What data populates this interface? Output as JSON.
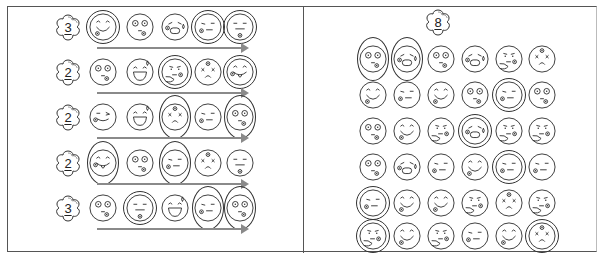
{
  "left_panel": {
    "rows": [
      {
        "count": "3",
        "faces": [
          {
            "type": "smile",
            "mark": "double"
          },
          {
            "type": "shock",
            "mark": "none"
          },
          {
            "type": "cry",
            "mark": "none"
          },
          {
            "type": "smirk",
            "mark": "double"
          },
          {
            "type": "flat",
            "mark": "double"
          }
        ]
      },
      {
        "count": "2",
        "faces": [
          {
            "type": "shock",
            "mark": "none"
          },
          {
            "type": "laugh",
            "mark": "none"
          },
          {
            "type": "think",
            "mark": "double"
          },
          {
            "type": "dizzy",
            "mark": "none"
          },
          {
            "type": "tongue",
            "mark": "double"
          }
        ]
      },
      {
        "count": "2",
        "faces": [
          {
            "type": "wink",
            "mark": "none"
          },
          {
            "type": "laugh",
            "mark": "none"
          },
          {
            "type": "dizzy",
            "mark": "oval"
          },
          {
            "type": "smirk",
            "mark": "none"
          },
          {
            "type": "shock",
            "mark": "oval"
          }
        ]
      },
      {
        "count": "2",
        "faces": [
          {
            "type": "tongue",
            "mark": "oval"
          },
          {
            "type": "shock",
            "mark": "none"
          },
          {
            "type": "smirk",
            "mark": "oval"
          },
          {
            "type": "dizzy",
            "mark": "none"
          },
          {
            "type": "flat",
            "mark": "none"
          }
        ]
      },
      {
        "count": "3",
        "faces": [
          {
            "type": "shock",
            "mark": "none"
          },
          {
            "type": "flat",
            "mark": "double"
          },
          {
            "type": "laugh",
            "mark": "none"
          },
          {
            "type": "smirk",
            "mark": "oval"
          },
          {
            "type": "shock",
            "mark": "oval"
          }
        ]
      }
    ]
  },
  "right_panel": {
    "count": "8",
    "grid": [
      [
        {
          "type": "shock",
          "mark": "oval"
        },
        {
          "type": "cry",
          "mark": "oval"
        },
        {
          "type": "shock",
          "mark": "none"
        },
        {
          "type": "cry",
          "mark": "none"
        },
        {
          "type": "think",
          "mark": "none"
        },
        {
          "type": "dizzy",
          "mark": "none"
        }
      ],
      [
        {
          "type": "smile",
          "mark": "none"
        },
        {
          "type": "smirk",
          "mark": "none"
        },
        {
          "type": "smile",
          "mark": "none"
        },
        {
          "type": "shock",
          "mark": "none"
        },
        {
          "type": "smirk",
          "mark": "double"
        },
        {
          "type": "shock",
          "mark": "none"
        }
      ],
      [
        {
          "type": "shock",
          "mark": "none"
        },
        {
          "type": "smile",
          "mark": "none"
        },
        {
          "type": "think",
          "mark": "none"
        },
        {
          "type": "cry",
          "mark": "double"
        },
        {
          "type": "think",
          "mark": "none"
        },
        {
          "type": "think",
          "mark": "none"
        }
      ],
      [
        {
          "type": "shock",
          "mark": "none"
        },
        {
          "type": "cry",
          "mark": "none"
        },
        {
          "type": "smirk",
          "mark": "none"
        },
        {
          "type": "smile",
          "mark": "none"
        },
        {
          "type": "smirk",
          "mark": "double"
        },
        {
          "type": "smirk",
          "mark": "none"
        }
      ],
      [
        {
          "type": "smirk",
          "mark": "double"
        },
        {
          "type": "smile",
          "mark": "none"
        },
        {
          "type": "smile",
          "mark": "none"
        },
        {
          "type": "think",
          "mark": "none"
        },
        {
          "type": "dizzy",
          "mark": "none"
        },
        {
          "type": "think",
          "mark": "none"
        }
      ],
      [
        {
          "type": "think",
          "mark": "double"
        },
        {
          "type": "smile",
          "mark": "none"
        },
        {
          "type": "think",
          "mark": "none"
        },
        {
          "type": "smirk",
          "mark": "none"
        },
        {
          "type": "smile",
          "mark": "none"
        },
        {
          "type": "dizzy",
          "mark": "double"
        }
      ]
    ]
  },
  "colors": {
    "line": "#333333",
    "arrow": "#8a8a8a",
    "border": "#555555"
  }
}
